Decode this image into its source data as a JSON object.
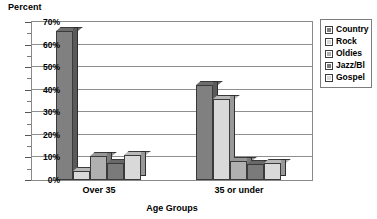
{
  "chart_data": {
    "type": "bar",
    "title": "",
    "xlabel": "Age Groups",
    "ylabel": "Percent",
    "categories": [
      "Over 35",
      "35 or under"
    ],
    "series": [
      {
        "name": "Country",
        "values": [
          66,
          42
        ],
        "color": "#808080"
      },
      {
        "name": "Rock",
        "values": [
          4,
          36
        ],
        "color": "#d9d9d9"
      },
      {
        "name": "Oldies",
        "values": [
          10.5,
          8.5
        ],
        "color": "#b0b0b0"
      },
      {
        "name": "Jazz/Bl",
        "values": [
          7.5,
          7
        ],
        "color": "#7a7a7a"
      },
      {
        "name": "Gospel",
        "values": [
          11,
          7.5
        ],
        "color": "#d9d9d9"
      }
    ],
    "ylim": [
      0,
      70
    ],
    "yticks": [
      0,
      10,
      20,
      30,
      40,
      50,
      60,
      70
    ],
    "ytick_labels": [
      "0%",
      "10%",
      "20%",
      "30%",
      "40%",
      "50%",
      "60%",
      "70%"
    ],
    "grid": true,
    "legend_position": "right",
    "legend_entries": [
      "Country",
      "Rock",
      "Oldies",
      "Jazz/Bl",
      "Gospel"
    ]
  },
  "axes": {
    "y_title": "Percent",
    "x_title": "Age Groups"
  }
}
